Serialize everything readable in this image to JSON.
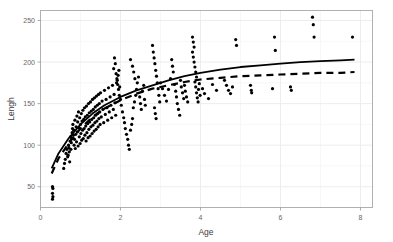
{
  "chart_data": {
    "type": "scatter",
    "title": "",
    "subtitle": "",
    "xlabel": "Age",
    "ylabel": "Lengh",
    "xlim": [
      0.0,
      8.3
    ],
    "ylim": [
      25,
      262
    ],
    "xticks": [
      0,
      2,
      4,
      6,
      8
    ],
    "xtick_labels": [
      "0",
      "2",
      "4",
      "6",
      "8"
    ],
    "yticks": [
      50,
      100,
      150,
      200,
      250
    ],
    "ytick_labels": [
      "50",
      "100",
      "150",
      "200",
      "250"
    ],
    "grid": true,
    "grid_color": "#ebebeb",
    "panel_background": "#ffffff",
    "panel_border_color": "#b0b0b0",
    "legend": null,
    "point_color": "#000000",
    "point_size": 1.6,
    "series": [
      {
        "name": "observations",
        "type": "scatter",
        "marker": "circle",
        "points": [
          [
            0.3,
            50
          ],
          [
            0.31,
            48
          ],
          [
            0.3,
            42
          ],
          [
            0.31,
            38
          ],
          [
            0.3,
            35
          ],
          [
            0.6,
            78
          ],
          [
            0.62,
            83
          ],
          [
            0.58,
            72
          ],
          [
            0.64,
            90
          ],
          [
            0.66,
            95
          ],
          [
            0.68,
            86
          ],
          [
            0.7,
            100
          ],
          [
            0.72,
            92
          ],
          [
            0.74,
            105
          ],
          [
            0.69,
            88
          ],
          [
            0.71,
            97
          ],
          [
            0.73,
            80
          ],
          [
            0.75,
            110
          ],
          [
            0.77,
            103
          ],
          [
            0.79,
            115
          ],
          [
            0.76,
            95
          ],
          [
            0.78,
            108
          ],
          [
            0.8,
            120
          ],
          [
            0.82,
            112
          ],
          [
            0.84,
            100
          ],
          [
            0.81,
            125
          ],
          [
            0.83,
            118
          ],
          [
            0.85,
            107
          ],
          [
            0.86,
            130
          ],
          [
            0.87,
            96
          ],
          [
            0.88,
            113
          ],
          [
            0.89,
            122
          ],
          [
            0.9,
            104
          ],
          [
            0.91,
            135
          ],
          [
            0.92,
            116
          ],
          [
            0.93,
            128
          ],
          [
            0.94,
            99
          ],
          [
            0.95,
            140
          ],
          [
            0.96,
            121
          ],
          [
            0.97,
            110
          ],
          [
            0.98,
            133
          ],
          [
            0.99,
            102
          ],
          [
            1.0,
            125
          ],
          [
            1.01,
            114
          ],
          [
            1.02,
            138
          ],
          [
            1.03,
            106
          ],
          [
            1.04,
            129
          ],
          [
            1.05,
            118
          ],
          [
            1.06,
            142
          ],
          [
            1.07,
            108
          ],
          [
            1.08,
            131
          ],
          [
            1.09,
            120
          ],
          [
            1.1,
            145
          ],
          [
            1.11,
            112
          ],
          [
            1.12,
            134
          ],
          [
            1.13,
            123
          ],
          [
            1.14,
            105
          ],
          [
            1.15,
            147
          ],
          [
            1.16,
            115
          ],
          [
            1.17,
            136
          ],
          [
            1.18,
            126
          ],
          [
            1.19,
            109
          ],
          [
            1.2,
            150
          ],
          [
            1.21,
            119
          ],
          [
            1.22,
            139
          ],
          [
            1.23,
            128
          ],
          [
            1.24,
            111
          ],
          [
            1.25,
            152
          ],
          [
            1.26,
            122
          ],
          [
            1.27,
            141
          ],
          [
            1.28,
            131
          ],
          [
            1.29,
            114
          ],
          [
            1.3,
            155
          ],
          [
            1.31,
            124
          ],
          [
            1.32,
            143
          ],
          [
            1.33,
            133
          ],
          [
            1.34,
            117
          ],
          [
            1.35,
            157
          ],
          [
            1.36,
            127
          ],
          [
            1.37,
            146
          ],
          [
            1.38,
            136
          ],
          [
            1.39,
            119
          ],
          [
            1.4,
            159
          ],
          [
            1.41,
            129
          ],
          [
            1.42,
            148
          ],
          [
            1.43,
            138
          ],
          [
            1.44,
            122
          ],
          [
            1.45,
            161
          ],
          [
            1.46,
            132
          ],
          [
            1.47,
            150
          ],
          [
            1.48,
            140
          ],
          [
            1.49,
            125
          ],
          [
            1.5,
            163
          ],
          [
            1.52,
            134
          ],
          [
            1.54,
            153
          ],
          [
            1.56,
            143
          ],
          [
            1.58,
            127
          ],
          [
            1.6,
            166
          ],
          [
            1.62,
            137
          ],
          [
            1.64,
            155
          ],
          [
            1.66,
            145
          ],
          [
            1.68,
            130
          ],
          [
            1.7,
            169
          ],
          [
            1.72,
            140
          ],
          [
            1.74,
            158
          ],
          [
            1.76,
            148
          ],
          [
            1.78,
            133
          ],
          [
            1.8,
            172
          ],
          [
            1.82,
            143
          ],
          [
            1.84,
            161
          ],
          [
            1.86,
            151
          ],
          [
            1.88,
            136
          ],
          [
            1.9,
            175
          ],
          [
            1.85,
            205
          ],
          [
            1.87,
            198
          ],
          [
            1.83,
            192
          ],
          [
            1.89,
            186
          ],
          [
            1.91,
            180
          ],
          [
            1.93,
            173
          ],
          [
            1.95,
            167
          ],
          [
            1.97,
            160
          ],
          [
            1.92,
            178
          ],
          [
            1.94,
            184
          ],
          [
            1.96,
            190
          ],
          [
            1.98,
            170
          ],
          [
            2.0,
            155
          ],
          [
            2.02,
            148
          ],
          [
            2.05,
            140
          ],
          [
            2.08,
            133
          ],
          [
            2.1,
            127
          ],
          [
            2.12,
            120
          ],
          [
            2.15,
            113
          ],
          [
            2.18,
            107
          ],
          [
            2.2,
            100
          ],
          [
            2.22,
            95
          ],
          [
            2.25,
            118
          ],
          [
            2.28,
            125
          ],
          [
            2.3,
            132
          ],
          [
            2.32,
            145
          ],
          [
            2.35,
            152
          ],
          [
            2.38,
            160
          ],
          [
            2.4,
            167
          ],
          [
            2.42,
            175
          ],
          [
            2.45,
            182
          ],
          [
            2.48,
            158
          ],
          [
            2.5,
            150
          ],
          [
            2.52,
            143
          ],
          [
            2.55,
            165
          ],
          [
            2.58,
            172
          ],
          [
            2.3,
            195
          ],
          [
            2.33,
            188
          ],
          [
            2.36,
            180
          ],
          [
            2.25,
            203
          ],
          [
            2.6,
            155
          ],
          [
            2.62,
            148
          ],
          [
            2.8,
            220
          ],
          [
            2.82,
            212
          ],
          [
            2.84,
            205
          ],
          [
            2.86,
            198
          ],
          [
            2.88,
            190
          ],
          [
            2.9,
            183
          ],
          [
            2.92,
            175
          ],
          [
            2.94,
            168
          ],
          [
            2.96,
            160
          ],
          [
            2.98,
            152
          ],
          [
            2.85,
            145
          ],
          [
            2.87,
            138
          ],
          [
            2.89,
            132
          ],
          [
            3.0,
            175
          ],
          [
            3.05,
            168
          ],
          [
            3.1,
            160
          ],
          [
            3.15,
            153
          ],
          [
            3.2,
            167
          ],
          [
            3.25,
            180
          ],
          [
            3.28,
            203
          ],
          [
            3.3,
            195
          ],
          [
            3.32,
            188
          ],
          [
            3.35,
            173
          ],
          [
            3.38,
            165
          ],
          [
            3.4,
            158
          ],
          [
            3.42,
            150
          ],
          [
            3.45,
            143
          ],
          [
            3.48,
            136
          ],
          [
            3.5,
            178
          ],
          [
            3.52,
            170
          ],
          [
            3.55,
            163
          ],
          [
            3.58,
            156
          ],
          [
            3.6,
            172
          ],
          [
            3.62,
            165
          ],
          [
            3.65,
            158
          ],
          [
            3.68,
            152
          ],
          [
            3.8,
            230
          ],
          [
            3.82,
            224
          ],
          [
            3.84,
            218
          ],
          [
            3.8,
            212
          ],
          [
            3.82,
            206
          ],
          [
            3.84,
            200
          ],
          [
            3.86,
            194
          ],
          [
            3.88,
            188
          ],
          [
            3.9,
            182
          ],
          [
            3.86,
            176
          ],
          [
            3.88,
            170
          ],
          [
            3.9,
            163
          ],
          [
            3.92,
            157
          ],
          [
            3.94,
            152
          ],
          [
            3.95,
            167
          ],
          [
            3.97,
            174
          ],
          [
            3.99,
            160
          ],
          [
            4.05,
            168
          ],
          [
            4.1,
            162
          ],
          [
            4.2,
            156
          ],
          [
            4.3,
            173
          ],
          [
            4.4,
            166
          ],
          [
            4.6,
            178
          ],
          [
            4.65,
            172
          ],
          [
            4.7,
            166
          ],
          [
            4.75,
            162
          ],
          [
            4.8,
            170
          ],
          [
            4.88,
            227
          ],
          [
            4.9,
            220
          ],
          [
            5.25,
            172
          ],
          [
            5.27,
            166
          ],
          [
            5.28,
            163
          ],
          [
            5.8,
            168
          ],
          [
            5.85,
            230
          ],
          [
            5.87,
            214
          ],
          [
            6.25,
            170
          ],
          [
            6.27,
            166
          ],
          [
            6.8,
            254
          ],
          [
            6.82,
            245
          ],
          [
            6.84,
            230
          ],
          [
            7.8,
            230
          ]
        ]
      },
      {
        "name": "fitted-curve-solid",
        "type": "line",
        "style": "solid",
        "color": "#000000",
        "width": 1.8,
        "points": [
          [
            0.28,
            72
          ],
          [
            0.45,
            90
          ],
          [
            0.7,
            108
          ],
          [
            1.0,
            125
          ],
          [
            1.3,
            138
          ],
          [
            1.6,
            148
          ],
          [
            2.0,
            158
          ],
          [
            2.4,
            166
          ],
          [
            2.8,
            172
          ],
          [
            3.2,
            178
          ],
          [
            3.6,
            183
          ],
          [
            4.0,
            187
          ],
          [
            4.5,
            191
          ],
          [
            5.0,
            194
          ],
          [
            5.5,
            196
          ],
          [
            6.0,
            198
          ],
          [
            6.5,
            200
          ],
          [
            7.0,
            201
          ],
          [
            7.5,
            202
          ],
          [
            7.85,
            203
          ]
        ]
      },
      {
        "name": "fitted-curve-dashed",
        "type": "line",
        "style": "dashed",
        "color": "#000000",
        "width": 2.2,
        "dash_pattern": "7,5",
        "points": [
          [
            0.28,
            66
          ],
          [
            0.45,
            84
          ],
          [
            0.7,
            102
          ],
          [
            1.0,
            120
          ],
          [
            1.3,
            134
          ],
          [
            1.6,
            144
          ],
          [
            2.0,
            154
          ],
          [
            2.4,
            162
          ],
          [
            2.8,
            168
          ],
          [
            3.2,
            172
          ],
          [
            3.6,
            176
          ],
          [
            4.0,
            179
          ],
          [
            4.5,
            181
          ],
          [
            5.0,
            183
          ],
          [
            5.5,
            184
          ],
          [
            6.0,
            185
          ],
          [
            6.5,
            186
          ],
          [
            7.0,
            187
          ],
          [
            7.5,
            187
          ],
          [
            7.85,
            188
          ]
        ]
      }
    ]
  },
  "axes": {
    "x_axis_name": "Age",
    "y_axis_name": "Lengh"
  }
}
